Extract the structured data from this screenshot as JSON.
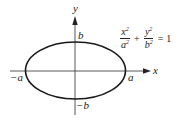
{
  "figure": {
    "type": "ellipse-diagram",
    "axes": {
      "x_label": "x",
      "y_label": "y"
    },
    "intercepts": {
      "x_negative": "−a",
      "x_positive": "a",
      "y_positive": "b",
      "y_negative": "−b"
    },
    "equation": {
      "term1_num": "x",
      "term1_den": "a",
      "term2_num": "y",
      "term2_den": "b",
      "exponent": "2",
      "plus": "+",
      "equals": "=",
      "rhs": "1"
    },
    "colors": {
      "stroke": "#222222",
      "background": "#ffffff"
    }
  }
}
